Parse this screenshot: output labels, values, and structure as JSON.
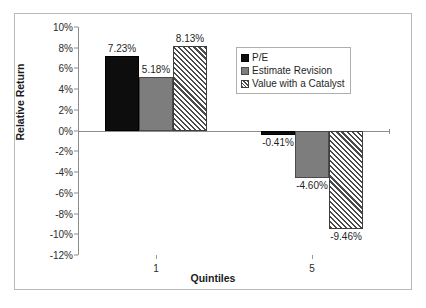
{
  "chart_data": {
    "type": "bar",
    "title": "",
    "xlabel": "Quintiles",
    "ylabel": "Relative Return",
    "categories": [
      "1",
      "5"
    ],
    "series": [
      {
        "name": "P/E",
        "values": [
          7.23,
          -0.41
        ],
        "labels": [
          "7.23%",
          "-0.41%"
        ],
        "swatch": "solid-black"
      },
      {
        "name": "Estimate Revision",
        "values": [
          5.18,
          -4.6
        ],
        "labels": [
          "5.18%",
          "-4.60%"
        ],
        "swatch": "solid-gray"
      },
      {
        "name": "Value with a Catalyst",
        "values": [
          8.13,
          -9.46
        ],
        "labels": [
          "8.13%",
          "-9.46%"
        ],
        "swatch": "diagonal-hatch"
      }
    ],
    "ylim": [
      -12,
      10
    ],
    "ytick_values": [
      10,
      8,
      6,
      4,
      2,
      0,
      -2,
      -4,
      -6,
      -8,
      -10,
      -12
    ],
    "ytick_labels": [
      "10%",
      "8%",
      "6%",
      "4%",
      "2%",
      "0%",
      "-2%",
      "-4%",
      "-6%",
      "-8%",
      "-10%",
      "-12%"
    ],
    "grid": false,
    "legend_position": "upper-right-inside",
    "colors": {
      "series_1": "#0d0d0d",
      "series_2": "#7d7d7d",
      "series_3": "#ffffff",
      "axis": "#8c8c8c",
      "text": "#1f1f1f",
      "frame": "#b9b9b9",
      "background": "#ffffff"
    }
  },
  "legend": {
    "items": [
      {
        "label": "P/E"
      },
      {
        "label": "Estimate Revision"
      },
      {
        "label": "Value with a Catalyst"
      }
    ]
  }
}
